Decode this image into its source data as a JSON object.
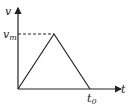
{
  "chart_data": {
    "type": "line",
    "title": "",
    "xlabel": "t",
    "ylabel": "v",
    "series": [
      {
        "name": "velocity",
        "points": [
          [
            0,
            0
          ],
          [
            0.5,
            1
          ],
          [
            1,
            0
          ]
        ]
      }
    ],
    "annotations": {
      "peak_label": "v",
      "peak_sub": "m",
      "end_label": "t",
      "end_sub": "0"
    },
    "dashed_reference": "horizontal line from v-axis to peak at v_m"
  }
}
